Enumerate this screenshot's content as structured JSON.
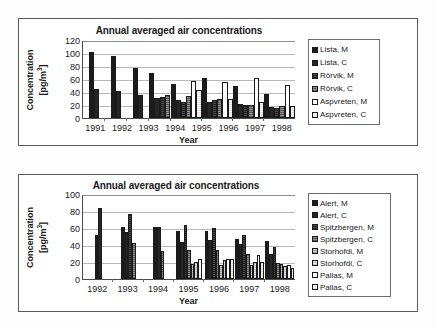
{
  "figure": {
    "background": "#fdfdfd",
    "panel_border": "#5a5a5a"
  },
  "charts": [
    {
      "id": "top",
      "title": "Annual averaged air concentrations",
      "xlabel": "Year",
      "ylabel_line1": "Concentration",
      "ylabel_line2": "[pg/m",
      "ylabel_sup": "3",
      "ylabel_line2_end": "]",
      "yticks": [
        "120",
        "100",
        "80",
        "60",
        "40",
        "20",
        "0"
      ],
      "categories": [
        "1991",
        "1992",
        "1993",
        "1994",
        "1995",
        "1996",
        "1997",
        "1998"
      ],
      "legend": [
        {
          "label": "Lista, M",
          "fill": "f-black"
        },
        {
          "label": "Lista, C",
          "fill": "f-black2"
        },
        {
          "label": "Rörvik, M",
          "fill": "f-dark"
        },
        {
          "label": "Rörvik, C",
          "fill": "f-mid"
        },
        {
          "label": "Aspvreten, M",
          "fill": "f-white"
        },
        {
          "label": "Aspvreten, C",
          "fill": "f-white2"
        }
      ]
    },
    {
      "id": "bottom",
      "title": "Annual averaged air concentrations",
      "xlabel": "Year",
      "ylabel_line1": "Concentration",
      "ylabel_line2": "[pg/m",
      "ylabel_sup": "3",
      "ylabel_line2_end": "]",
      "yticks": [
        "100",
        "80",
        "60",
        "40",
        "20",
        "0"
      ],
      "categories": [
        "1992",
        "1993",
        "1994",
        "1995",
        "1996",
        "1997",
        "1998"
      ],
      "legend": [
        {
          "label": "Alert, M",
          "fill": "f-black"
        },
        {
          "label": "Alert, C",
          "fill": "f-black2"
        },
        {
          "label": "Spitzbergen, M",
          "fill": "f-dark"
        },
        {
          "label": "Spitzbergen, C",
          "fill": "f-mid"
        },
        {
          "label": "Storhofdi, M",
          "fill": "f-light"
        },
        {
          "label": "Storhofdi, C",
          "fill": "f-vlight"
        },
        {
          "label": "Pallas, M",
          "fill": "f-white"
        },
        {
          "label": "Pallas, C",
          "fill": "f-white2"
        }
      ]
    }
  ],
  "chart_data": [
    {
      "type": "bar",
      "title": "Annual averaged air concentrations",
      "xlabel": "Year",
      "ylabel": "Concentration [pg/m3]",
      "ylim": [
        0,
        120
      ],
      "ytick_step": 20,
      "grid": true,
      "legend_position": "right",
      "categories": [
        "1991",
        "1992",
        "1993",
        "1994",
        "1995",
        "1996",
        "1997",
        "1998"
      ],
      "series": [
        {
          "name": "Lista, M",
          "values": [
            102,
            95,
            77,
            69,
            52,
            61,
            50,
            37
          ]
        },
        {
          "name": "Lista, C",
          "values": [
            45,
            42,
            36,
            31,
            28,
            25,
            21,
            17
          ]
        },
        {
          "name": "Rörvik, M",
          "values": [
            null,
            null,
            null,
            32,
            25,
            28,
            20,
            15
          ]
        },
        {
          "name": "Rörvik, C",
          "values": [
            null,
            null,
            null,
            35,
            34,
            29,
            20,
            18
          ]
        },
        {
          "name": "Aspvreten, M",
          "values": [
            null,
            null,
            null,
            null,
            57,
            55,
            61,
            51
          ]
        },
        {
          "name": "Aspvreten, C",
          "values": [
            null,
            null,
            null,
            null,
            43,
            29,
            24,
            18
          ]
        }
      ]
    },
    {
      "type": "bar",
      "title": "Annual averaged air concentrations",
      "xlabel": "Year",
      "ylabel": "Concentration [pg/m3]",
      "ylim": [
        0,
        100
      ],
      "ytick_step": 20,
      "grid": true,
      "legend_position": "right",
      "categories": [
        "1992",
        "1993",
        "1994",
        "1995",
        "1996",
        "1997",
        "1998"
      ],
      "series": [
        {
          "name": "Alert, M",
          "values": [
            52,
            61,
            61,
            56,
            57,
            47,
            45
          ]
        },
        {
          "name": "Alert, C",
          "values": [
            84,
            55,
            61,
            43,
            46,
            41,
            29
          ]
        },
        {
          "name": "Spitzbergen, M",
          "values": [
            null,
            77,
            null,
            63,
            60,
            52,
            38
          ]
        },
        {
          "name": "Spitzbergen, C",
          "values": [
            null,
            42,
            33,
            34,
            34,
            29,
            19
          ]
        },
        {
          "name": "Storhofdi, M",
          "values": [
            null,
            null,
            null,
            18,
            17,
            17,
            18
          ]
        },
        {
          "name": "Storhofdi, C",
          "values": [
            null,
            null,
            null,
            20,
            22,
            20,
            15
          ]
        },
        {
          "name": "Pallas, M",
          "values": [
            null,
            null,
            null,
            24,
            23,
            28,
            16
          ]
        },
        {
          "name": "Pallas, C",
          "values": [
            null,
            null,
            null,
            null,
            23,
            20,
            13
          ]
        }
      ]
    }
  ]
}
